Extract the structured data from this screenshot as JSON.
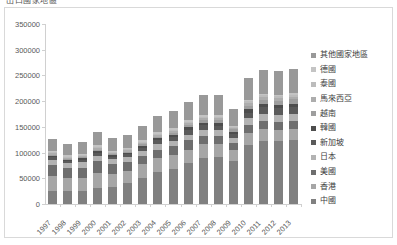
{
  "chart_title": "出口國家地區",
  "chart_data": {
    "type": "bar",
    "stacked": true,
    "title": "出口國家地區",
    "xlabel": "",
    "ylabel": "",
    "ylim": [
      0,
      350000
    ],
    "ytick_values": [
      0,
      50000,
      100000,
      150000,
      200000,
      250000,
      300000,
      350000
    ],
    "ytick_labels": [
      "0",
      "50000",
      "100000",
      "150000",
      "200000",
      "250000",
      "300000",
      "350000"
    ],
    "grid": false,
    "legend_position": "right",
    "categories": [
      "1997",
      "1998",
      "1999",
      "2000",
      "2001",
      "2002",
      "2003",
      "2004",
      "2005",
      "2006",
      "2007",
      "2008",
      "2009",
      "2010",
      "2011",
      "2012",
      "2013"
    ],
    "series": [
      {
        "name": "中國",
        "color": "#808080",
        "values": [
          26000,
          25000,
          26000,
          31000,
          33000,
          40000,
          51000,
          62000,
          69000,
          79000,
          89000,
          91000,
          84000,
          114000,
          122000,
          122000,
          124000
        ]
      },
      {
        "name": "香港",
        "color": "#a6a6a6",
        "values": [
          28000,
          25000,
          25000,
          30000,
          26000,
          25000,
          26000,
          27000,
          27000,
          27000,
          27000,
          25000,
          21000,
          24000,
          23000,
          22000,
          22000
        ]
      },
      {
        "name": "美國",
        "color": "#6e6e6e",
        "values": [
          21000,
          20000,
          20000,
          22000,
          18000,
          17000,
          16000,
          17000,
          17000,
          18000,
          17000,
          16000,
          13000,
          16000,
          17000,
          16000,
          16000
        ]
      },
      {
        "name": "日本",
        "color": "#b3b3b3",
        "values": [
          11000,
          9000,
          10000,
          11000,
          10000,
          10000,
          10000,
          11000,
          10000,
          11000,
          11000,
          11000,
          10000,
          13000,
          14000,
          14000,
          13000
        ]
      },
      {
        "name": "新加坡",
        "color": "#5a5a5a",
        "values": [
          5000,
          4000,
          5000,
          6000,
          5000,
          5000,
          6000,
          7000,
          8000,
          9000,
          9000,
          9000,
          8000,
          11000,
          12000,
          12000,
          13000
        ]
      },
      {
        "name": "韓國",
        "color": "#4d4d4d",
        "values": [
          3000,
          3000,
          3000,
          4000,
          3000,
          3000,
          4000,
          4000,
          4000,
          5000,
          5000,
          5000,
          4000,
          6000,
          6000,
          6000,
          6000
        ]
      },
      {
        "name": "越南",
        "color": "#9e9e9e",
        "values": [
          2000,
          2000,
          2000,
          2000,
          2000,
          2000,
          3000,
          3000,
          4000,
          4000,
          5000,
          6000,
          5000,
          7000,
          9000,
          9000,
          10000
        ]
      },
      {
        "name": "馬來西亞",
        "color": "#adadad",
        "values": [
          3000,
          2000,
          2000,
          3000,
          2000,
          3000,
          3000,
          3000,
          3000,
          4000,
          4000,
          4000,
          3000,
          5000,
          5000,
          5000,
          5000
        ]
      },
      {
        "name": "泰國",
        "color": "#bcbcbc",
        "values": [
          2000,
          2000,
          2000,
          2000,
          2000,
          2000,
          2000,
          3000,
          3000,
          3000,
          3000,
          3000,
          2000,
          4000,
          4000,
          4000,
          4000
        ]
      },
      {
        "name": "德國",
        "color": "#c4c4c4",
        "values": [
          3000,
          3000,
          3000,
          3000,
          3000,
          3000,
          3000,
          3000,
          3000,
          3000,
          3000,
          3000,
          2000,
          3000,
          3000,
          3000,
          3000
        ]
      },
      {
        "name": "其他國家地區",
        "color": "#999999",
        "values": [
          22000,
          21000,
          22000,
          26000,
          24000,
          25000,
          27000,
          31000,
          33000,
          36000,
          39000,
          39000,
          32000,
          42000,
          45000,
          46000,
          47000
        ]
      }
    ]
  },
  "legend": {
    "items": [
      {
        "label": "其他國家地區",
        "color": "#999999"
      },
      {
        "label": "德國",
        "color": "#c4c4c4"
      },
      {
        "label": "泰國",
        "color": "#bcbcbc"
      },
      {
        "label": "馬來西亞",
        "color": "#adadad"
      },
      {
        "label": "越南",
        "color": "#9e9e9e"
      },
      {
        "label": "韓國",
        "color": "#4d4d4d"
      },
      {
        "label": "新加坡",
        "color": "#5a5a5a"
      },
      {
        "label": "日本",
        "color": "#b3b3b3"
      },
      {
        "label": "美國",
        "color": "#6e6e6e"
      },
      {
        "label": "香港",
        "color": "#a6a6a6"
      },
      {
        "label": "中國",
        "color": "#808080"
      }
    ]
  }
}
